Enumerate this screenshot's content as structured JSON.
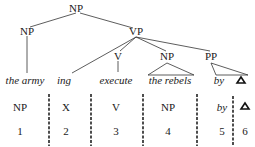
{
  "tree": {
    "root": "NP",
    "left_np": "NP",
    "vp": "VP",
    "v": "V",
    "np_obj": "NP",
    "pp": "PP",
    "leaves": {
      "the_army": "the army",
      "ing": "ing",
      "execute": "execute",
      "the_rebels": "the rebels",
      "by": "by"
    }
  },
  "analysis": {
    "categories": [
      "NP",
      "X",
      "V",
      "NP",
      "by"
    ],
    "indices": [
      "1",
      "2",
      "3",
      "4",
      "5",
      "6"
    ]
  }
}
